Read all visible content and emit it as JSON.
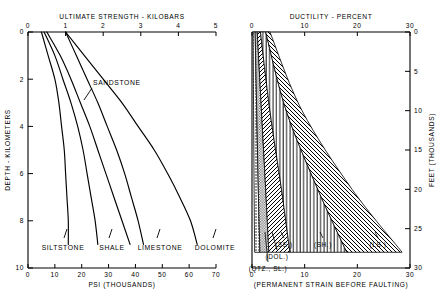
{
  "figure": {
    "panels": [
      {
        "id": "left",
        "top_axis": {
          "title": "ULTIMATE STRENGTH - KILOBARS",
          "ticks": [
            0,
            1,
            2,
            3,
            4,
            5
          ],
          "min": 0,
          "max": 5
        },
        "bottom_axis": {
          "title": "PSI (THOUSANDS)",
          "ticks": [
            0,
            10,
            20,
            30,
            40,
            50,
            60,
            70
          ],
          "min": 0,
          "max": 70
        },
        "left_axis": {
          "title": "DEPTH - KILOMETERS",
          "ticks": [
            0,
            2,
            4,
            6,
            8,
            10
          ],
          "min": 0,
          "max": 10
        },
        "annotations": [
          {
            "text": "SANDSTONE",
            "x": 93,
            "y": 85
          },
          {
            "text": "SILTSTONE",
            "x": 63,
            "y": 250
          },
          {
            "text": "SHALE",
            "x": 112,
            "y": 250
          },
          {
            "text": "LIMESTONE",
            "x": 160,
            "y": 250
          },
          {
            "text": "DOLOMITE",
            "x": 215,
            "y": 250
          }
        ]
      },
      {
        "id": "right",
        "top_axis": {
          "title": "DUCTILITY - PERCENT",
          "ticks": [
            0,
            10,
            20,
            30
          ],
          "min": 0,
          "max": 30
        },
        "bottom_axis": {
          "title": "(PERMANENT STRAIN BEFORE FAULTING)",
          "ticks": [
            0,
            10,
            20,
            30
          ],
          "min": 0,
          "max": 30
        },
        "right_axis": {
          "title": "FEET (THOUSANDS)",
          "ticks": [
            0,
            5,
            10,
            15,
            20,
            25,
            30
          ],
          "min": 0,
          "max": 30
        },
        "annotations": [
          {
            "text": "(SS.)",
            "x": 284,
            "y": 247
          },
          {
            "text": "(DOL.)",
            "x": 277,
            "y": 259
          },
          {
            "text": "(QTZ., SL.)",
            "x": 268,
            "y": 271
          },
          {
            "text": "(SH.)",
            "x": 323,
            "y": 247
          },
          {
            "text": "(LS.)",
            "x": 378,
            "y": 247
          }
        ]
      }
    ]
  },
  "chart_data": {
    "type": "line",
    "panels": [
      {
        "name": "Ultimate Strength",
        "type": "line",
        "title": "ULTIMATE STRENGTH - KILOBARS",
        "xlabel": "PSI (THOUSANDS)",
        "xlabel_top": "ULTIMATE STRENGTH - KILOBARS",
        "ylabel": "DEPTH - KILOMETERS",
        "xlim": [
          0,
          70
        ],
        "xlim_top": [
          0,
          5
        ],
        "ylim": [
          0,
          10
        ],
        "y_inverted": true,
        "grid": false,
        "xticks": [
          0,
          10,
          20,
          30,
          40,
          50,
          60,
          70
        ],
        "xticks_top": [
          0,
          1,
          2,
          3,
          4,
          5
        ],
        "yticks": [
          0,
          2,
          4,
          6,
          8,
          10
        ],
        "series": [
          {
            "name": "SILTSTONE",
            "points_psi_depth": [
              [
                5,
                0
              ],
              [
                7.5,
                1
              ],
              [
                10,
                2
              ],
              [
                11.5,
                3
              ],
              [
                12.5,
                4
              ],
              [
                13.5,
                5
              ],
              [
                14,
                6
              ],
              [
                14.5,
                7
              ],
              [
                15,
                8
              ],
              [
                15,
                9
              ]
            ]
          },
          {
            "name": "SHALE",
            "points_psi_depth": [
              [
                6,
                0
              ],
              [
                10,
                1
              ],
              [
                13,
                2
              ],
              [
                16,
                3
              ],
              [
                18.5,
                4
              ],
              [
                20.5,
                5
              ],
              [
                22,
                6
              ],
              [
                23.5,
                7
              ],
              [
                25,
                8
              ],
              [
                26,
                9
              ]
            ]
          },
          {
            "name": "SANDSTONE",
            "points_psi_depth": [
              [
                7,
                0
              ],
              [
                12,
                1
              ],
              [
                16,
                2
              ],
              [
                19.5,
                3
              ],
              [
                23,
                4
              ],
              [
                26,
                5
              ],
              [
                29,
                6
              ],
              [
                32,
                7
              ],
              [
                35,
                8
              ],
              [
                38,
                9
              ]
            ]
          },
          {
            "name": "LIMESTONE",
            "points_psi_depth": [
              [
                14,
                0
              ],
              [
                18,
                1
              ],
              [
                22,
                2
              ],
              [
                26,
                3
              ],
              [
                29.5,
                4
              ],
              [
                33,
                5
              ],
              [
                36,
                6
              ],
              [
                38.5,
                7
              ],
              [
                41,
                8
              ],
              [
                43,
                9
              ]
            ]
          },
          {
            "name": "DOLOMITE",
            "points_psi_depth": [
              [
                14,
                0
              ],
              [
                21,
                1
              ],
              [
                28,
                2
              ],
              [
                35,
                3
              ],
              [
                41,
                4
              ],
              [
                47,
                5
              ],
              [
                52,
                6
              ],
              [
                56.5,
                7
              ],
              [
                60.5,
                8
              ],
              [
                63,
                9
              ]
            ]
          }
        ]
      },
      {
        "name": "Ductility",
        "type": "area",
        "title": "DUCTILITY - PERCENT",
        "xlabel": "(PERMANENT STRAIN BEFORE FAULTING)",
        "xlabel_top": "DUCTILITY - PERCENT",
        "ylabel": "FEET (THOUSANDS)",
        "xlim": [
          0,
          30
        ],
        "ylim": [
          0,
          30
        ],
        "y_inverted": true,
        "grid": false,
        "xticks": [
          0,
          10,
          20,
          30
        ],
        "yticks": [
          0,
          5,
          10,
          15,
          20,
          25,
          30
        ],
        "bands": [
          {
            "name": "(QTZ., SL.)",
            "label": "(QTZ., SL.)",
            "hatch": "dotted",
            "lower_percent_depth": [
              [
                0.2,
                0
              ],
              [
                0.3,
                10
              ],
              [
                0.4,
                20
              ],
              [
                0.5,
                28
              ]
            ],
            "upper_percent_depth": [
              [
                0.6,
                0
              ],
              [
                0.9,
                10
              ],
              [
                1.2,
                20
              ],
              [
                1.5,
                28
              ]
            ]
          },
          {
            "name": "(DOL.)",
            "label": "(DOL.)",
            "hatch": "stipple",
            "lower_percent_depth": [
              [
                0.6,
                0
              ],
              [
                0.9,
                10
              ],
              [
                1.2,
                20
              ],
              [
                1.5,
                28
              ]
            ],
            "upper_percent_depth": [
              [
                1.0,
                0
              ],
              [
                1.8,
                10
              ],
              [
                2.6,
                20
              ],
              [
                3.2,
                28
              ]
            ]
          },
          {
            "name": "(SS.)",
            "label": "(SS.)",
            "hatch": "diagonal-left",
            "lower_percent_depth": [
              [
                1.0,
                0
              ],
              [
                1.8,
                10
              ],
              [
                2.6,
                20
              ],
              [
                3.2,
                28
              ]
            ],
            "upper_percent_depth": [
              [
                1.6,
                0
              ],
              [
                3.4,
                10
              ],
              [
                5.6,
                20
              ],
              [
                7.2,
                28
              ]
            ]
          },
          {
            "name": "(SH.)",
            "label": "(SH.)",
            "hatch": "vertical",
            "lower_percent_depth": [
              [
                1.6,
                0
              ],
              [
                3.4,
                10
              ],
              [
                5.6,
                20
              ],
              [
                7.2,
                28
              ]
            ],
            "upper_percent_depth": [
              [
                2.6,
                0
              ],
              [
                6.5,
                10
              ],
              [
                12.5,
                20
              ],
              [
                18.0,
                28
              ]
            ]
          },
          {
            "name": "(LS.)",
            "label": "(LS.)",
            "hatch": "diagonal-right",
            "lower_percent_depth": [
              [
                2.6,
                0
              ],
              [
                6.5,
                10
              ],
              [
                12.5,
                20
              ],
              [
                18.0,
                28
              ]
            ],
            "upper_percent_depth": [
              [
                3.4,
                0
              ],
              [
                9.5,
                10
              ],
              [
                19.0,
                20
              ],
              [
                28.5,
                28
              ]
            ]
          }
        ]
      }
    ]
  }
}
